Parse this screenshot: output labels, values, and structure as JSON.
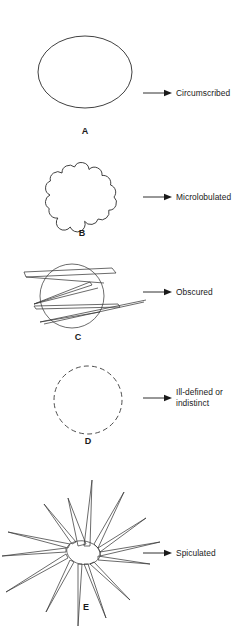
{
  "figure": {
    "background_color": "#ffffff",
    "ink_color": "#2b2b2b",
    "label_color": "#1a1a1a",
    "panels": [
      {
        "letter": "A",
        "label": "Circumscribed",
        "shape": "smooth-ellipse",
        "label_lines": [
          "Circumscribed"
        ]
      },
      {
        "letter": "B",
        "label": "Microlobulated",
        "shape": "scalloped-lobulated",
        "lobules": 14,
        "label_lines": [
          "Microlobulated"
        ]
      },
      {
        "letter": "C",
        "label": "Obscured",
        "shape": "circle-overlapped-by-bands",
        "label_lines": [
          "Obscured"
        ]
      },
      {
        "letter": "D",
        "label": "Ill-defined or indistinct",
        "shape": "dashed-circle",
        "label_lines": [
          "Ill-defined or",
          "indistinct"
        ]
      },
      {
        "letter": "E",
        "label": "Spiculated",
        "shape": "star-spicules",
        "spicules": 13,
        "label_lines": [
          "Spiculated"
        ]
      }
    ]
  }
}
